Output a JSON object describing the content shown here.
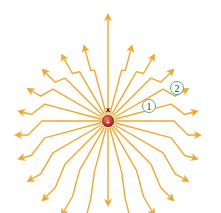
{
  "diagram": {
    "title": "",
    "center": {
      "x": 108,
      "y": 121
    },
    "charge_marker": "x",
    "line_color": "#f0a830",
    "line_color_dark": "#e8962a",
    "charge_color": "#c0392b",
    "label_ring_color": "#5aa88a",
    "field_lines": 24,
    "inner_radius": 48,
    "kink_radius": 62,
    "outer_radius": 92,
    "labels": [
      {
        "text": "1",
        "x": 149,
        "y": 106
      },
      {
        "text": "2",
        "x": 177,
        "y": 88
      }
    ]
  }
}
